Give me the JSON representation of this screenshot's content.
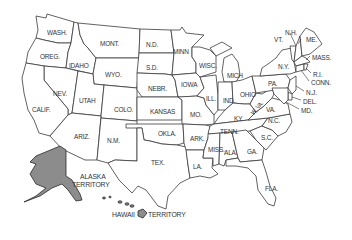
{
  "map": {
    "title": "United States Map",
    "colors": {
      "land": "#ffffff",
      "border": "#3a3a3a",
      "territory": "#8c8c8c",
      "label": "#333333"
    },
    "states": [
      {
        "id": "wash",
        "label": "WASH.",
        "x": 47,
        "y": 29
      },
      {
        "id": "oreg",
        "label": "OREG.",
        "x": 40,
        "y": 53
      },
      {
        "id": "idaho",
        "label": "IDAHO",
        "x": 69,
        "y": 62
      },
      {
        "id": "mont",
        "label": "MONT.",
        "x": 100,
        "y": 40
      },
      {
        "id": "wyo",
        "label": "WYO.",
        "x": 105,
        "y": 71
      },
      {
        "id": "nev",
        "label": "NEV.",
        "x": 53,
        "y": 90
      },
      {
        "id": "utah",
        "label": "UTAH",
        "x": 79,
        "y": 97
      },
      {
        "id": "calif",
        "label": "CALIF.",
        "x": 32,
        "y": 106
      },
      {
        "id": "colo",
        "label": "COLO.",
        "x": 114,
        "y": 106
      },
      {
        "id": "ariz",
        "label": "ARIZ.",
        "x": 74,
        "y": 133
      },
      {
        "id": "nm",
        "label": "N.M.",
        "x": 107,
        "y": 137
      },
      {
        "id": "nd",
        "label": "N.D.",
        "x": 146,
        "y": 41
      },
      {
        "id": "sd",
        "label": "S.D.",
        "x": 146,
        "y": 64
      },
      {
        "id": "nebr",
        "label": "NEBR.",
        "x": 148,
        "y": 85
      },
      {
        "id": "kansas",
        "label": "KANSAS",
        "x": 150,
        "y": 108
      },
      {
        "id": "okla",
        "label": "OKLA.",
        "x": 158,
        "y": 130
      },
      {
        "id": "tex",
        "label": "TEX.",
        "x": 151,
        "y": 159
      },
      {
        "id": "minn",
        "label": "MINN",
        "x": 173,
        "y": 48
      },
      {
        "id": "iowa",
        "label": "IOWA",
        "x": 181,
        "y": 81
      },
      {
        "id": "mo",
        "label": "MO.",
        "x": 190,
        "y": 111
      },
      {
        "id": "ark",
        "label": "ARK.",
        "x": 190,
        "y": 135
      },
      {
        "id": "la",
        "label": "LA.",
        "x": 193,
        "y": 163
      },
      {
        "id": "wisc",
        "label": "WISC.",
        "x": 199,
        "y": 62
      },
      {
        "id": "ill",
        "label": "ILL.",
        "x": 206,
        "y": 95
      },
      {
        "id": "mich",
        "label": "MICH",
        "x": 227,
        "y": 72
      },
      {
        "id": "ind",
        "label": "IND.",
        "x": 223,
        "y": 97
      },
      {
        "id": "ohio",
        "label": "OHIO",
        "x": 240,
        "y": 91
      },
      {
        "id": "ky",
        "label": "KY.",
        "x": 234,
        "y": 115
      },
      {
        "id": "tenn",
        "label": "TENN.",
        "x": 220,
        "y": 128
      },
      {
        "id": "miss",
        "label": "MISS.",
        "x": 208,
        "y": 146
      },
      {
        "id": "ala",
        "label": "ALA.",
        "x": 224,
        "y": 149
      },
      {
        "id": "ga",
        "label": "GA.",
        "x": 247,
        "y": 148
      },
      {
        "id": "fla",
        "label": "FLA.",
        "x": 265,
        "y": 185
      },
      {
        "id": "sc",
        "label": "S.C.",
        "x": 261,
        "y": 134
      },
      {
        "id": "nc",
        "label": "N.C.",
        "x": 268,
        "y": 117
      },
      {
        "id": "va",
        "label": "VA.",
        "x": 266,
        "y": 106
      },
      {
        "id": "wva",
        "label": "W. VA.",
        "x": 252,
        "y": 108
      },
      {
        "id": "pa",
        "label": "PA.",
        "x": 268,
        "y": 80
      },
      {
        "id": "ny",
        "label": "N.Y.",
        "x": 278,
        "y": 63
      },
      {
        "id": "vt",
        "label": "VT.",
        "x": 274,
        "y": 36
      },
      {
        "id": "nh",
        "label": "N.H.",
        "x": 285,
        "y": 29
      },
      {
        "id": "me",
        "label": "ME.",
        "x": 306,
        "y": 36
      },
      {
        "id": "mass",
        "label": "MASS.",
        "x": 312,
        "y": 54
      },
      {
        "id": "ri",
        "label": "R.I.",
        "x": 313,
        "y": 71
      },
      {
        "id": "conn",
        "label": "CONN.",
        "x": 311,
        "y": 79
      },
      {
        "id": "nj",
        "label": "N.J.",
        "x": 306,
        "y": 89
      },
      {
        "id": "del",
        "label": "DEL.",
        "x": 303,
        "y": 98
      },
      {
        "id": "md",
        "label": "MD.",
        "x": 301,
        "y": 107
      }
    ],
    "territories": [
      {
        "id": "alaska",
        "label_line1": "ALASKA",
        "label_line2": "TERRITORY",
        "x": 74,
        "y": 173
      },
      {
        "id": "hawaii",
        "label_left": "HAWAII",
        "label_right": "TERRITORY",
        "x": 110,
        "y": 214
      }
    ]
  }
}
